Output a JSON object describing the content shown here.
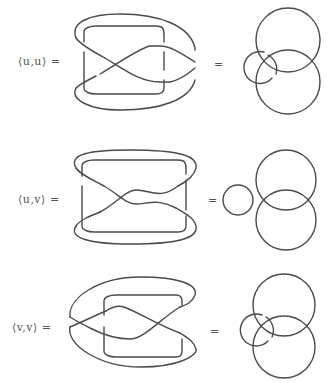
{
  "figure": {
    "rows": [
      {
        "id": "uu",
        "label": "⟨u,u⟩ =",
        "equals": "=",
        "right_diagram": "two large overlapping circles with a small circle linked through them on the left"
      },
      {
        "id": "uv",
        "label": "⟨u,v⟩ =",
        "equals": "=",
        "right_diagram": "two large overlapping circles with a small separate circle tangent on the left"
      },
      {
        "id": "vv",
        "label": "⟨v,v⟩ =",
        "equals": "=",
        "right_diagram": "two large overlapping circles with a small circle linked through them on the left"
      }
    ],
    "stroke_color": "#4a4a4a",
    "label_color": "#555555"
  }
}
